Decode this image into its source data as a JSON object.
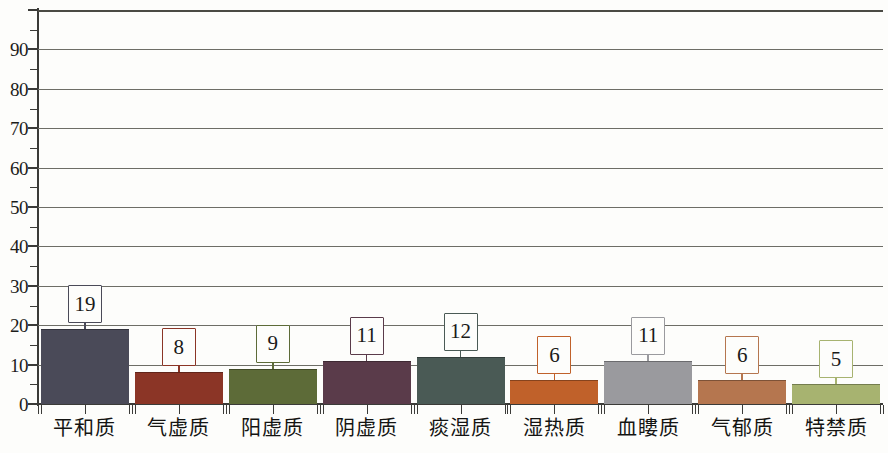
{
  "chart_data": {
    "type": "bar",
    "title": "",
    "subtitle": "",
    "xlabel": "",
    "ylabel": "",
    "ylim": [
      0,
      100
    ],
    "y_major_step": 10,
    "y_minor_step": 5,
    "grid": "horizontal",
    "legend": "none",
    "categories": [
      "平和质",
      "气虚质",
      "阳虚质",
      "阴虚质",
      "痰湿质",
      "湿热质",
      "血瞜质",
      "气郁质",
      "特禁质"
    ],
    "values": [
      19,
      8,
      9,
      11,
      12,
      6,
      11,
      6,
      5
    ],
    "data_labels": [
      "19",
      "8",
      "9",
      "11",
      "12",
      "6",
      "11",
      "6",
      "5"
    ],
    "bar_colors": [
      "#4a4a58",
      "#8b3526",
      "#5d6b38",
      "#5a3b4a",
      "#4a5a55",
      "#c0612a",
      "#9a9a9e",
      "#b5764f",
      "#a7b370"
    ],
    "y_tick_labels": [
      "0",
      "10",
      "20",
      "30",
      "40",
      "50",
      "60",
      "70",
      "80",
      "90"
    ],
    "y_tick_values": [
      0,
      10,
      20,
      30,
      40,
      50,
      60,
      70,
      80,
      90
    ],
    "axis_color": "#3b3b38",
    "gridline_color": "#6d6d66",
    "background_color": "#fdfdfb"
  }
}
